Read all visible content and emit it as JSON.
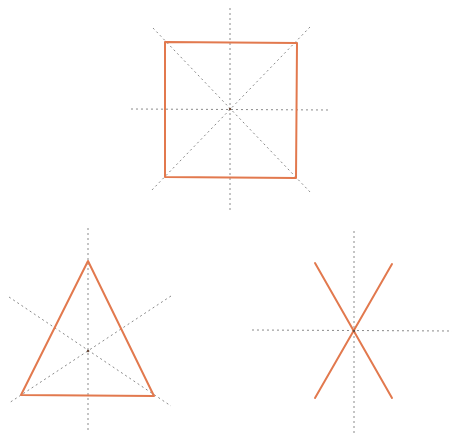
{
  "diagram": {
    "title": "",
    "colors": {
      "shape_stroke": "#E2794E",
      "symmetry_line": "#8A8A8A",
      "background": "#FFFFFF"
    },
    "stroke_widths": {
      "shape": 2,
      "symmetry_line": 1
    },
    "dash_pattern": "2 3",
    "figures": [
      {
        "id": "square",
        "label": "Square",
        "polygon": [
          [
            165,
            42
          ],
          [
            297,
            43
          ],
          [
            296,
            178
          ],
          [
            165,
            177
          ]
        ],
        "center": [
          230,
          109
        ],
        "symmetry_lines": [
          [
            [
              230,
              8
            ],
            [
              230,
              213
            ]
          ],
          [
            [
              131,
              109
            ],
            [
              330,
              110
            ]
          ],
          [
            [
              153,
              28
            ],
            [
              311,
              193
            ]
          ],
          [
            [
              310,
              27
            ],
            [
              151,
              191
            ]
          ]
        ]
      },
      {
        "id": "triangle",
        "label": "Equilateral Triangle",
        "polygon": [
          [
            88,
            261
          ],
          [
            154,
            396
          ],
          [
            21,
            395
          ]
        ],
        "center": [
          88,
          351
        ],
        "symmetry_lines": [
          [
            [
              88,
              228
            ],
            [
              88,
              431
            ]
          ],
          [
            [
              9,
              297
            ],
            [
              171,
              406
            ]
          ],
          [
            [
              171,
              296
            ],
            [
              9,
              403
            ]
          ]
        ]
      },
      {
        "id": "x-star",
        "label": "X figure",
        "segments": [
          [
            [
              315,
              263
            ],
            [
              392,
              398
            ]
          ],
          [
            [
              392,
              264
            ],
            [
              315,
              398
            ]
          ]
        ],
        "center": [
          354,
          331
        ],
        "symmetry_lines": [
          [
            [
              354,
              231
            ],
            [
              354,
              434
            ]
          ],
          [
            [
              252,
              330
            ],
            [
              452,
              331
            ]
          ]
        ]
      }
    ]
  }
}
